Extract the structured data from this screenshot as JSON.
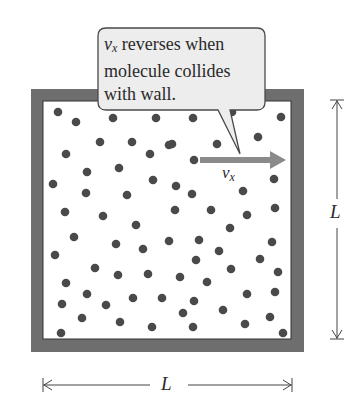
{
  "callout": {
    "symbol": "v",
    "subscript": "x",
    "line1_rest": " reverses when",
    "line2": "molecule collides",
    "line3": "with wall."
  },
  "arrow_label": {
    "symbol": "v",
    "subscript": "x"
  },
  "dimensions": {
    "vertical_label": "L",
    "horizontal_label": "L"
  },
  "colors": {
    "wall": "#6e6e6e",
    "molecule": "#4a4a4a",
    "arrow": "#8a8a8a",
    "callout_fill": "#ededed",
    "callout_stroke": "#4a4a4a",
    "dimension_line": "#444444"
  },
  "molecules": [
    [
      58,
      112
    ],
    [
      76,
      122
    ],
    [
      113,
      118
    ],
    [
      156,
      118
    ],
    [
      193,
      118
    ],
    [
      232,
      112
    ],
    [
      281,
      117
    ],
    [
      100,
      142
    ],
    [
      132,
      142
    ],
    [
      169,
      145
    ],
    [
      172,
      144
    ],
    [
      217,
      144
    ],
    [
      258,
      137
    ],
    [
      66,
      154
    ],
    [
      150,
      154
    ],
    [
      194,
      160
    ],
    [
      87,
      172
    ],
    [
      119,
      168
    ],
    [
      274,
      179
    ],
    [
      53,
      184
    ],
    [
      153,
      180
    ],
    [
      176,
      186
    ],
    [
      192,
      194
    ],
    [
      243,
      191
    ],
    [
      86,
      193
    ],
    [
      127,
      195
    ],
    [
      65,
      212
    ],
    [
      103,
      216
    ],
    [
      175,
      210
    ],
    [
      211,
      210
    ],
    [
      247,
      215
    ],
    [
      275,
      208
    ],
    [
      136,
      225
    ],
    [
      230,
      228
    ],
    [
      74,
      237
    ],
    [
      116,
      244
    ],
    [
      143,
      249
    ],
    [
      169,
      241
    ],
    [
      199,
      240
    ],
    [
      272,
      242
    ],
    [
      55,
      255
    ],
    [
      219,
      251
    ],
    [
      196,
      260
    ],
    [
      260,
      259
    ],
    [
      95,
      268
    ],
    [
      118,
      275
    ],
    [
      148,
      274
    ],
    [
      231,
      269
    ],
    [
      278,
      272
    ],
    [
      66,
      283
    ],
    [
      180,
      277
    ],
    [
      207,
      282
    ],
    [
      87,
      294
    ],
    [
      133,
      298
    ],
    [
      162,
      298
    ],
    [
      194,
      301
    ],
    [
      247,
      294
    ],
    [
      275,
      292
    ],
    [
      62,
      304
    ],
    [
      106,
      305
    ],
    [
      223,
      310
    ],
    [
      82,
      318
    ],
    [
      120,
      322
    ],
    [
      183,
      313
    ],
    [
      270,
      317
    ],
    [
      152,
      327
    ],
    [
      193,
      327
    ],
    [
      245,
      324
    ],
    [
      61,
      333
    ],
    [
      283,
      333
    ]
  ]
}
